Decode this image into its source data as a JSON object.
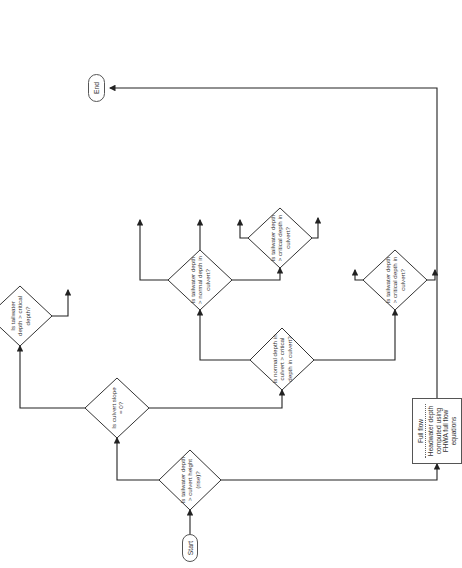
{
  "diagram": {
    "type": "flowchart",
    "orientation": "rotated 90deg counter-clockwise",
    "terminals": {
      "start": "Start",
      "end": "End"
    },
    "decisions": {
      "submerged": "Is tailwater depth > culvert height (rise)?",
      "horizontal": "Is culvert slope = 0?",
      "tw_critical_horizontal": "Is tailwater depth > critical depth?",
      "subcritical": "Is normal depth in culvert > critical depth in culvert?",
      "tw_normal": "Is tailwater depth > normal depth in culvert?",
      "tw_critical_mild": "Is tailwater depth > critical depth in culvert?",
      "tw_critical_steep": "Is tailwater depth > critical depth in culvert?"
    },
    "decision_lines": {
      "submerged": [
        "Is",
        "tailwater",
        "depth >",
        "culvert height",
        "(rise)?"
      ],
      "horizontal": [
        "Is",
        "culvert",
        "slope = 0?"
      ],
      "tw_critical_horizontal": [
        "Is",
        "tailwater",
        "depth >",
        "critical",
        "depth?"
      ],
      "subcritical": [
        "Is",
        "normal",
        "depth in",
        "culvert > critical",
        "depth in",
        "culvert?"
      ],
      "tw_normal": [
        "Is",
        "tailwater",
        "depth >",
        "normal depth",
        "in culvert?"
      ],
      "tw_critical_mild": [
        "Is",
        "tailwater",
        "depth >",
        "critical depth",
        "in culvert?"
      ],
      "tw_critical_steep": [
        "Is",
        "tailwater",
        "depth >",
        "critical depth",
        "in culvert?"
      ]
    },
    "processes": {
      "full_flow": {
        "title": "Full flow",
        "body": "Headwater depth computed using FHWA full flow equations"
      },
      "h2": {
        "title": "H2 drawdown profile",
        "body": "Inlet depth computed using direct step method Critical depth assumed as downstream boundary"
      },
      "horizontal_tw": {
        "title": "",
        "body": "Inlet depth computed using direct step method Tailwater depth assumed as downstream boundary"
      },
      "uniform": {
        "title": "Uniform flow",
        "body": "Inlet depth = tailwater depth"
      },
      "m1": {
        "title": "M1 backwater profile",
        "body": "Inlet depth computed using direct step method"
      },
      "m2_critical": {
        "title": "M2 drawdown profile",
        "body": "Inlet depth computed using direct step method starting with critical depth"
      },
      "m2_tailwater": {
        "title": "M2 drawdown profile",
        "body": "Inlet depth computed using direct step method starting with tailwater depth"
      },
      "s1": {
        "title": "S1 backwater profile",
        "body": "Inlet depth computed using direct step method"
      },
      "critical_inlet": {
        "title": "",
        "body": "Inlet depth = critical depth"
      },
      "headwater": {
        "title": "",
        "body": "Headwater depth = inlet depth + entrance loss"
      }
    },
    "edge_labels": {
      "not_submerged": "No, outlet is not submerged",
      "submerged": "Yes, outlet is submerged",
      "slope_horizontal": "Yes, slope is horizontal",
      "slope_positive": "No, slope is positive",
      "subcritical": "Yes, flow is sub-critical",
      "supercritical": "No, flow is super-critical",
      "tw_le_normal": "No, tailwater depth < normal depth",
      "tw_eq_normal": "No, tailwater depth = normal depth",
      "yes": "Yes",
      "no": "No"
    },
    "caption": "Figure ... Flowchart for ..."
  }
}
